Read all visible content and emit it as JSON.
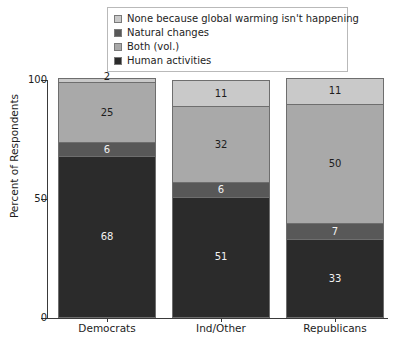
{
  "chart_data": {
    "type": "bar",
    "subtype": "stacked-bar-100",
    "title": "",
    "xlabel": "",
    "ylabel": "Percent of Respondents",
    "ylim": [
      0,
      100
    ],
    "yticks": [
      0,
      50,
      100
    ],
    "grid": false,
    "legend_position": "top-center",
    "categories": [
      "Democrats",
      "Ind/Other",
      "Republicans"
    ],
    "series": [
      {
        "name": "None because global warming isn't happening",
        "color": "#c9c9c9",
        "label_color": "#1d1d1d",
        "values": [
          2,
          11,
          11
        ]
      },
      {
        "name": "Both (vol.)",
        "color": "#a9a9a9",
        "label_color": "#1d1d1d",
        "values": [
          25,
          32,
          50
        ]
      },
      {
        "name": "Natural changes",
        "color": "#585858",
        "label_color": "#f2f2f2",
        "values": [
          6,
          6,
          7
        ]
      },
      {
        "name": "Human activities",
        "color": "#2b2b2b",
        "label_color": "#f2f2f2",
        "values": [
          68,
          51,
          33
        ]
      }
    ]
  },
  "legend": {
    "items": [
      {
        "label": "None because global warming isn't happening",
        "color": "#c9c9c9"
      },
      {
        "label": "Natural changes",
        "color": "#585858"
      },
      {
        "label": "Both (vol.)",
        "color": "#a9a9a9"
      },
      {
        "label": "Human activities",
        "color": "#2b2b2b"
      }
    ]
  },
  "axes": {
    "y_title": "Percent of Respondents",
    "y_tick_labels": [
      "100",
      "50",
      "0"
    ],
    "x_tick_labels": [
      "Democrats",
      "Ind/Other",
      "Republicans"
    ]
  }
}
